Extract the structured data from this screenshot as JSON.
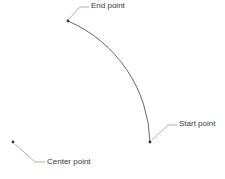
{
  "diagram": {
    "labels": {
      "end": "End point",
      "start": "Start point",
      "center": "Center point"
    },
    "points": {
      "end": [
        68,
        21
      ],
      "start": [
        150,
        142
      ],
      "center": [
        13,
        142
      ]
    },
    "colors": {
      "arc": "#555555",
      "leader": "#9a9a9a",
      "point": "#333333",
      "text": "#3a3a3a"
    }
  }
}
